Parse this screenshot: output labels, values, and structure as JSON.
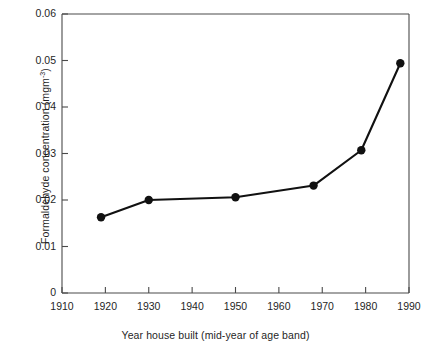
{
  "chart_data": {
    "type": "line",
    "title": "",
    "xlabel": "Year house built (mid-year of age band)",
    "ylabel": "Formaldehyde concentration (mgm",
    "ylabel_exponent": "-3",
    "ylabel_suffix": ")",
    "xlim": [
      1910,
      1990
    ],
    "ylim": [
      0,
      0.06
    ],
    "xticks": [
      1910,
      1920,
      1930,
      1940,
      1950,
      1960,
      1970,
      1980,
      1990
    ],
    "xtick_labels": [
      "1910",
      "1920",
      "1930",
      "1940",
      "1950",
      "1960",
      "1970",
      "1980",
      "1990"
    ],
    "yticks": [
      0,
      0.01,
      0.02,
      0.03,
      0.04,
      0.05,
      0.06
    ],
    "ytick_labels": [
      "0",
      "0.01",
      "0.02",
      "0.03",
      "0.04",
      "0.05",
      "0.06"
    ],
    "grid": false,
    "legend": false,
    "series": [
      {
        "name": "Formaldehyde concentration",
        "marker": "filled-circle",
        "color": "#111111",
        "x": [
          1919,
          1930,
          1950,
          1968,
          1979,
          1988
        ],
        "y": [
          0.0163,
          0.02,
          0.0206,
          0.0231,
          0.0307,
          0.0494
        ]
      }
    ]
  },
  "axes": {
    "frame_color": "#4a4a4a",
    "line_color": "#111111"
  }
}
